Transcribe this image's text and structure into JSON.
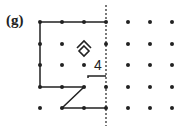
{
  "figure": {
    "label": "(g)",
    "grid": {
      "cols_x": [
        40,
        62,
        84,
        106,
        128,
        150,
        172
      ],
      "rows_y": [
        22,
        44,
        65,
        87,
        108
      ]
    },
    "divider_x": 106,
    "annotations": {
      "digit": "4",
      "symbol": "diamond-in-chevron"
    },
    "colors": {
      "ink": "#222222"
    }
  }
}
